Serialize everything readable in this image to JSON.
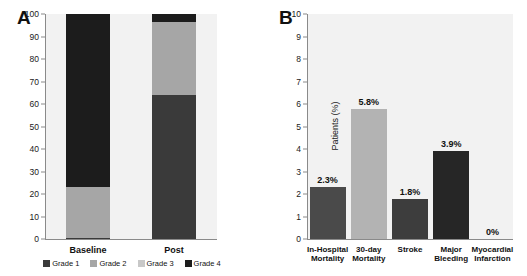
{
  "figure": {
    "panel_a_letter": "A",
    "panel_b_letter": "B"
  },
  "chart_data": [
    {
      "type": "bar",
      "panel": "A",
      "stacked": true,
      "title": "",
      "xlabel": "",
      "ylabel": "Patients (%)",
      "ylim": [
        0,
        100
      ],
      "yticks": [
        0,
        10,
        20,
        30,
        40,
        50,
        60,
        70,
        80,
        90,
        100
      ],
      "grid": false,
      "legend_position": "bottom",
      "categories": [
        "Baseline",
        "Post"
      ],
      "series": [
        {
          "name": "Grade 1",
          "values": [
            0.5,
            64.0
          ],
          "color": "#3a3a3a"
        },
        {
          "name": "Grade 2",
          "values": [
            22.5,
            32.5
          ],
          "color": "#a6a6a6"
        },
        {
          "name": "Grade 3",
          "values": [
            0.0,
            0.0
          ],
          "color": "#c8c8c8"
        },
        {
          "name": "Grade 4",
          "values": [
            77.0,
            3.5
          ],
          "color": "#1c1c1c"
        }
      ]
    },
    {
      "type": "bar",
      "panel": "B",
      "stacked": false,
      "title": "",
      "xlabel": "",
      "ylabel": "Patients (%)",
      "ylim": [
        0,
        10
      ],
      "yticks": [
        0,
        1,
        2,
        3,
        4,
        5,
        6,
        7,
        8,
        9,
        10
      ],
      "grid": false,
      "categories": [
        "In-Hospital Mortality",
        "30-day Mortality",
        "Stroke",
        "Major Bleeding",
        "Myocardial Infarction"
      ],
      "category_lines": [
        [
          "In-Hospital",
          "Mortality"
        ],
        [
          "30-day",
          "Mortality"
        ],
        [
          "Stroke",
          ""
        ],
        [
          "Major",
          "Bleeding"
        ],
        [
          "Myocardial",
          "Infarction"
        ]
      ],
      "values": [
        2.3,
        5.8,
        1.8,
        3.9,
        0
      ],
      "data_labels": [
        "2.3%",
        "5.8%",
        "1.8%",
        "3.9%",
        "0%"
      ],
      "colors": [
        "#4a4a4a",
        "#b3b3b3",
        "#3d3d3d",
        "#262626",
        "#262626"
      ]
    }
  ],
  "colors": {
    "plot_background": "#f2f2f2",
    "axis": "#8a8a8a",
    "text": "#111111"
  }
}
